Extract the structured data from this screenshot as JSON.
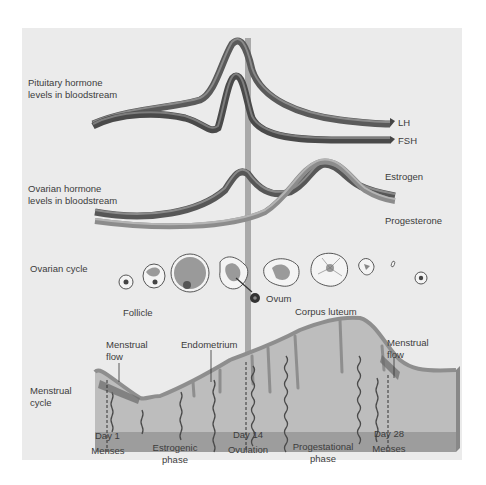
{
  "diagram": {
    "sections": {
      "pituitary": {
        "label_line1": "Pituitary hormone",
        "label_line2": "levels in bloodstream"
      },
      "ovarian_hormone": {
        "label_line1": "Ovarian hormone",
        "label_line2": "levels in bloodstream"
      },
      "ovarian_cycle": {
        "label": "Ovarian cycle"
      },
      "menstrual_cycle": {
        "label_line1": "Menstrual",
        "label_line2": "cycle"
      }
    },
    "curves": {
      "lh": "LH",
      "fsh": "FSH",
      "estrogen": "Estrogen",
      "progesterone": "Progesterone"
    },
    "ovary_labels": {
      "follicle": "Follicle",
      "ovum": "Ovum",
      "corpus_luteum": "Corpus luteum"
    },
    "uterus_labels": {
      "menstrual_flow_left_1": "Menstrual",
      "menstrual_flow_left_2": "flow",
      "endometrium": "Endometrium",
      "menstrual_flow_right_1": "Menstrual",
      "menstrual_flow_right_2": "flow"
    },
    "timeline": [
      {
        "line1": "Day 1",
        "line2": "Menses"
      },
      {
        "line1": "Estrogenic",
        "line2": "phase"
      },
      {
        "line1": "Day 14",
        "line2": "Ovulation"
      },
      {
        "line1": "Progestational",
        "line2": "phase"
      },
      {
        "line1": "Day 28",
        "line2": "Menses"
      }
    ],
    "colors": {
      "panel_bg": "#ebebeb",
      "ribbon_dark": "#555555",
      "ribbon_mid": "#7a7a7a",
      "ribbon_light": "#9a9a9a",
      "ovulation_bar": "#a8a8a8",
      "endometrium": "#bdbdbd",
      "endometrium_edge": "#8e8e8e",
      "base_layer": "#9e9e9e"
    }
  }
}
